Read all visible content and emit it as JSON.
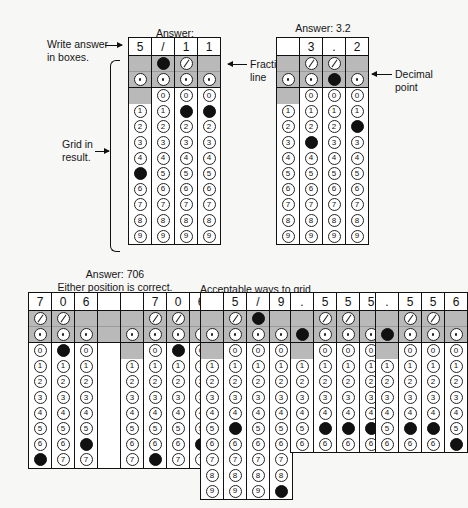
{
  "page": {
    "background_color": "#f7f7f5",
    "ink_color": "#111111",
    "shaded_color": "#b9b9b9"
  },
  "annotations": {
    "write_answer": "Write answer\nin boxes.",
    "grid_in_result": "Grid in\nresult.",
    "fraction_line": "Fraction\nline",
    "decimal_point": "Decimal\npoint"
  },
  "sections": [
    {
      "id": "fraction-example",
      "caption_prefix": "Answer:",
      "caption_fraction": {
        "numerator": "5",
        "denominator": "11"
      },
      "grids": [
        {
          "id": "grid-5-over-11",
          "rows_shown": 10,
          "columns": [
            {
              "written": "5",
              "symbol_row1": "blank",
              "symbol_row2": "dot-empty",
              "zero": "blocked",
              "filled": "5"
            },
            {
              "written": "/",
              "symbol_row1": "slash-filled",
              "symbol_row2": "dot-empty",
              "zero": "empty",
              "filled": null
            },
            {
              "written": "1",
              "symbol_row1": "slash-empty",
              "symbol_row2": "dot-empty",
              "zero": "empty",
              "filled": "1"
            },
            {
              "written": "1",
              "symbol_row1": "blank",
              "symbol_row2": "dot-empty",
              "zero": "empty",
              "filled": "1"
            }
          ]
        }
      ]
    },
    {
      "id": "decimal-example",
      "caption_prefix": "Answer: 3.2",
      "caption_fraction": null,
      "grids": [
        {
          "id": "grid-3-point-2",
          "rows_shown": 10,
          "columns": [
            {
              "written": "",
              "symbol_row1": "blank",
              "symbol_row2": "dot-empty",
              "zero": "blocked",
              "filled": null
            },
            {
              "written": "3",
              "symbol_row1": "slash-empty",
              "symbol_row2": "dot-empty",
              "zero": "empty",
              "filled": "3"
            },
            {
              "written": ".",
              "symbol_row1": "slash-empty",
              "symbol_row2": "dot-filled",
              "zero": "empty",
              "filled": null
            },
            {
              "written": "2",
              "symbol_row1": "blank",
              "symbol_row2": "dot-empty",
              "zero": "empty",
              "filled": "2"
            }
          ]
        }
      ]
    },
    {
      "id": "either-position-example",
      "caption_prefix": "Answer: 706",
      "caption_sub": "Either position is correct.",
      "grids": [
        {
          "id": "grid-706-left",
          "rows_shown": 8,
          "columns": [
            {
              "written": "7",
              "symbol_row1": "slash-empty",
              "symbol_row2": "dot-empty",
              "zero": "empty",
              "filled": "7"
            },
            {
              "written": "0",
              "symbol_row1": "slash-empty",
              "symbol_row2": "dot-empty",
              "zero": "filled",
              "filled": null
            },
            {
              "written": "6",
              "symbol_row1": "blank",
              "symbol_row2": "dot-empty",
              "zero": "empty",
              "filled": "6"
            },
            {
              "written": "",
              "symbol_row1": "blank",
              "symbol_row2": "blank",
              "zero": "blank",
              "filled": null
            }
          ]
        },
        {
          "id": "grid-706-right",
          "rows_shown": 8,
          "columns": [
            {
              "written": "",
              "symbol_row1": "blank",
              "symbol_row2": "dot-empty",
              "zero": "blocked",
              "filled": null
            },
            {
              "written": "7",
              "symbol_row1": "slash-empty",
              "symbol_row2": "dot-empty",
              "zero": "empty",
              "filled": "7"
            },
            {
              "written": "0",
              "symbol_row1": "slash-empty",
              "symbol_row2": "dot-empty",
              "zero": "filled",
              "filled": null
            },
            {
              "written": "6",
              "symbol_row1": "blank",
              "symbol_row2": "dot-empty",
              "zero": "empty",
              "filled": "6"
            }
          ]
        }
      ]
    },
    {
      "id": "acceptable-ways",
      "caption_prefix": "Acceptable ways to grid",
      "caption_fraction": {
        "numerator": "5",
        "denominator": "9"
      },
      "caption_suffix": "are:",
      "grids": [
        {
          "id": "grid-5-slash-9",
          "rows_shown": 10,
          "columns": [
            {
              "written": "",
              "symbol_row1": "blank",
              "symbol_row2": "dot-empty",
              "zero": "blocked",
              "filled": null
            },
            {
              "written": "5",
              "symbol_row1": "slash-empty",
              "symbol_row2": "dot-empty",
              "zero": "empty",
              "filled": "5"
            },
            {
              "written": "/",
              "symbol_row1": "slash-filled",
              "symbol_row2": "dot-empty",
              "zero": "empty",
              "filled": null
            },
            {
              "written": "9",
              "symbol_row1": "blank",
              "symbol_row2": "dot-empty",
              "zero": "empty",
              "filled": "9"
            }
          ]
        },
        {
          "id": "grid-point-555",
          "rows_shown": 7,
          "columns": [
            {
              "written": ".",
              "symbol_row1": "blank",
              "symbol_row2": "dot-filled",
              "zero": "blocked",
              "filled": null
            },
            {
              "written": "5",
              "symbol_row1": "slash-empty",
              "symbol_row2": "dot-empty",
              "zero": "empty",
              "filled": "5"
            },
            {
              "written": "5",
              "symbol_row1": "slash-empty",
              "symbol_row2": "dot-empty",
              "zero": "empty",
              "filled": "5"
            },
            {
              "written": "5",
              "symbol_row1": "blank",
              "symbol_row2": "dot-empty",
              "zero": "empty",
              "filled": "5"
            }
          ]
        },
        {
          "id": "grid-point-556",
          "rows_shown": 7,
          "columns": [
            {
              "written": ".",
              "symbol_row1": "blank",
              "symbol_row2": "dot-filled",
              "zero": "blocked",
              "filled": null
            },
            {
              "written": "5",
              "symbol_row1": "slash-empty",
              "symbol_row2": "dot-empty",
              "zero": "empty",
              "filled": "5"
            },
            {
              "written": "5",
              "symbol_row1": "slash-empty",
              "symbol_row2": "dot-empty",
              "zero": "empty",
              "filled": "5"
            },
            {
              "written": "6",
              "symbol_row1": "blank",
              "symbol_row2": "dot-empty",
              "zero": "empty",
              "filled": "6"
            }
          ]
        }
      ]
    }
  ],
  "digits": [
    "0",
    "1",
    "2",
    "3",
    "4",
    "5",
    "6",
    "7",
    "8",
    "9"
  ]
}
